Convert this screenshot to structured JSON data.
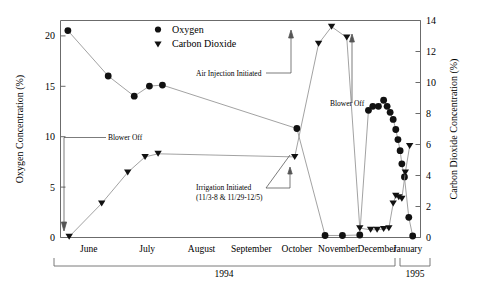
{
  "chart_data": {
    "type": "line",
    "title": "",
    "xlabel": "",
    "ylabel": "Oxygen Concentration (%)",
    "y2label": "Carbon Dioxide Concentration (%)",
    "ylim": [
      0,
      21.5
    ],
    "y2lim": [
      0,
      14
    ],
    "yticks": [
      0,
      5,
      10,
      15,
      20
    ],
    "ytick_labels": [
      "0",
      "5",
      "10",
      "15",
      "20"
    ],
    "y2ticks": [
      0,
      2,
      4,
      6,
      8,
      10,
      12,
      14
    ],
    "y2tick_labels": [
      "0",
      "2",
      "4",
      "6",
      "8",
      "10",
      "12",
      "14"
    ],
    "grid": false,
    "legend_position": "top-center",
    "categories": [
      "June",
      "July",
      "August",
      "September",
      "October",
      "November",
      "December",
      "January"
    ],
    "x_group_labels": [
      "1994",
      "1995"
    ],
    "series": [
      {
        "name": "Oxygen",
        "marker": "circle",
        "axis": "left",
        "x": [
          0.02,
          0.95,
          1.55,
          1.9,
          2.2,
          5.3,
          5.95,
          6.35,
          6.75,
          6.95,
          7.05,
          7.18,
          7.3,
          7.38,
          7.45,
          7.52,
          7.58,
          7.63,
          7.68,
          7.72,
          7.78,
          7.88,
          7.97
        ],
        "values": [
          20.5,
          16.0,
          14.0,
          15.0,
          15.1,
          10.8,
          0.2,
          0.2,
          0.25,
          12.6,
          13.0,
          13.0,
          13.6,
          13.0,
          12.4,
          11.7,
          10.7,
          9.7,
          8.6,
          7.3,
          6.0,
          2.0,
          0.15
        ]
      },
      {
        "name": "Carbon Dioxide",
        "marker": "triangle-down",
        "axis": "right",
        "x": [
          0.05,
          0.8,
          1.4,
          1.8,
          2.1,
          5.25,
          5.8,
          6.1,
          6.45,
          6.75,
          7.0,
          7.15,
          7.3,
          7.42,
          7.52,
          7.58,
          7.65,
          7.72,
          7.8,
          7.9
        ],
        "values": [
          0.05,
          2.2,
          4.2,
          5.2,
          5.4,
          5.2,
          12.5,
          13.6,
          12.9,
          0.6,
          0.5,
          0.5,
          0.55,
          0.6,
          2.2,
          2.7,
          2.6,
          2.5,
          4.2,
          5.9
        ]
      }
    ],
    "annotations": [
      {
        "text": "Blower Off",
        "id": "blower-off-left"
      },
      {
        "text": "Air Injection Initiated",
        "id": "air-injection-initiated"
      },
      {
        "text": "Irrigation Initiated",
        "id": "irrigation-initiated"
      },
      {
        "text": "(11/3-8 & 11/29-12/5)",
        "id": "irrigation-initiated-dates"
      },
      {
        "text": "Blower Off",
        "id": "blower-off-right"
      }
    ],
    "colors": {
      "marker": "#111111",
      "line": "#8a8a8a",
      "axis": "#6b6b6b",
      "text": "#000000",
      "background": "#ffffff"
    }
  },
  "legend": {
    "items": [
      {
        "label": "Oxygen",
        "marker": "circle"
      },
      {
        "label": "Carbon Dioxide",
        "marker": "triangle-down"
      }
    ]
  },
  "axes": {
    "left_title": "Oxygen Concentration (%)",
    "right_title": "Carbon Dioxide Concentration (%)",
    "left_ticks": [
      "0",
      "5",
      "10",
      "15",
      "20"
    ],
    "right_ticks": [
      "0",
      "2",
      "4",
      "6",
      "8",
      "10",
      "12",
      "14"
    ]
  },
  "xaxis": {
    "months": [
      "June",
      "July",
      "August",
      "September",
      "October",
      "November",
      "December",
      "January"
    ],
    "years": [
      "1994",
      "1995"
    ]
  },
  "annotations": {
    "blower_off_left": "Blower Off",
    "air_injection": "Air Injection Initiated",
    "irrigation_line1": "Irrigation Initiated",
    "irrigation_line2": "(11/3-8 & 11/29-12/5)",
    "blower_off_right": "Blower Off"
  }
}
